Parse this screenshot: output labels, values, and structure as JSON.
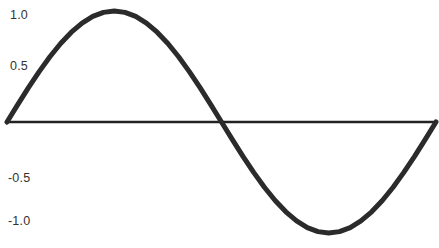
{
  "chart_data": {
    "type": "line",
    "title": "",
    "subtitle": "",
    "xlabel": "",
    "ylabel": "",
    "legend": [],
    "legend_position": "none",
    "grid": false,
    "xlim": [
      0,
      6.2832
    ],
    "ylim": [
      -1.15,
      1.15
    ],
    "ytick_labels": [
      "1.0",
      "0.5",
      "-0.5",
      "-1.0"
    ],
    "ytick_values": [
      1.0,
      0.5,
      -0.5,
      -1.0
    ],
    "xtick_labels": [],
    "xtick_values": [],
    "zero_axis_visible": true,
    "series": [
      {
        "name": "sine",
        "x": [
          0.0,
          0.1571,
          0.3142,
          0.4712,
          0.6283,
          0.7854,
          0.9425,
          1.0996,
          1.2566,
          1.4137,
          1.5708,
          1.7279,
          1.885,
          2.042,
          2.1991,
          2.3562,
          2.5133,
          2.6704,
          2.8274,
          2.9845,
          3.1416,
          3.2987,
          3.4558,
          3.6128,
          3.7699,
          3.927,
          4.0841,
          4.2412,
          4.3982,
          4.5553,
          4.7124,
          4.8695,
          5.0265,
          5.1836,
          5.3407,
          5.4978,
          5.6549,
          5.8119,
          5.969,
          6.1261,
          6.2832
        ],
        "y": [
          0.0,
          0.1564,
          0.309,
          0.454,
          0.5878,
          0.7071,
          0.809,
          0.891,
          0.9511,
          0.9877,
          1.0,
          0.9877,
          0.9511,
          0.891,
          0.809,
          0.7071,
          0.5878,
          0.454,
          0.309,
          0.1564,
          0.0,
          -0.1564,
          -0.309,
          -0.454,
          -0.5878,
          -0.7071,
          -0.809,
          -0.891,
          -0.9511,
          -0.9877,
          -1.0,
          -0.9877,
          -0.9511,
          -0.891,
          -0.809,
          -0.7071,
          -0.5878,
          -0.454,
          -0.309,
          -0.1564,
          0.0
        ]
      }
    ],
    "colors": {
      "line": "#2b2b2b",
      "axis": "#232323",
      "background": "#ffffff",
      "tick_text": "#333333"
    },
    "line_width": 5,
    "annotations": []
  }
}
